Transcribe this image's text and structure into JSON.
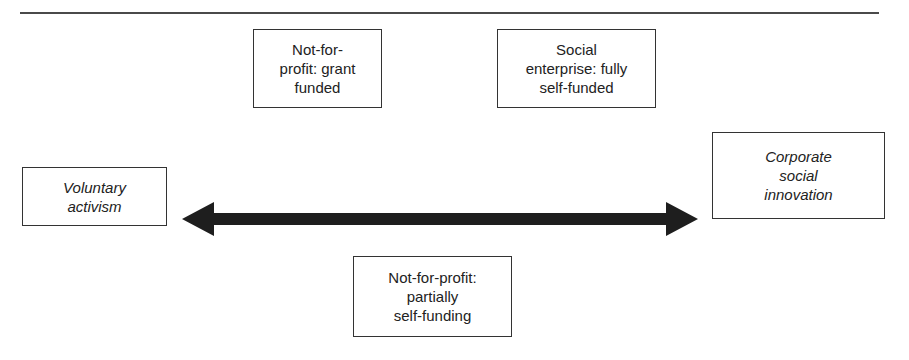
{
  "diagram": {
    "type": "spectrum",
    "colors": {
      "line": "#4a4a4a",
      "arrow": "#1e1e1e",
      "border": "#333333",
      "text": "#222222"
    },
    "arrow": {
      "style": "double-headed",
      "from": "Voluntary activism",
      "to": "Corporate social innovation"
    },
    "endpoints": {
      "left": {
        "lines": [
          "Voluntary",
          "activism"
        ]
      },
      "right": {
        "lines": [
          "Corporate",
          "social",
          "innovation"
        ]
      }
    },
    "boxes": {
      "grant": {
        "lines": [
          "Not-for-",
          "profit: grant",
          "funded"
        ]
      },
      "social": {
        "lines": [
          "Social",
          "enterprise: fully",
          "self-funded"
        ]
      },
      "partial": {
        "lines": [
          "Not-for-profit:",
          "partially",
          "self-funding"
        ]
      }
    }
  }
}
